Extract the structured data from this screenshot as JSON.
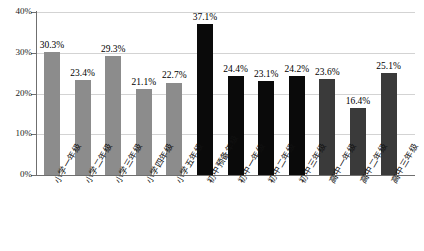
{
  "chart_data": {
    "type": "bar",
    "title": "",
    "subtitle": "",
    "xlabel": "",
    "ylabel": "",
    "ylim": [
      0,
      40
    ],
    "grid": true,
    "legend_position": "none",
    "ytick_labels": [
      "0%",
      "10%",
      "20%",
      "30%",
      "40%"
    ],
    "ytick_values": [
      0,
      10,
      20,
      30,
      40
    ],
    "categories": [
      "小学一年级",
      "小学二年级",
      "小学三年级",
      "小学四年级",
      "小学五年级",
      "初中预备年级",
      "初中一年级",
      "初中二年级",
      "初中三年级",
      "高中一年级",
      "高中二年级",
      "高中三年级"
    ],
    "values": [
      30.3,
      23.4,
      29.3,
      21.1,
      22.7,
      37.1,
      24.4,
      23.1,
      24.2,
      23.6,
      16.4,
      25.1
    ],
    "value_labels": [
      "30.3%",
      "23.4%",
      "29.3%",
      "21.1%",
      "22.7%",
      "37.1%",
      "24.4%",
      "23.1%",
      "24.2%",
      "23.6%",
      "16.4%",
      "25.1%"
    ],
    "bar_colors": [
      "#8c8c8c",
      "#8c8c8c",
      "#8c8c8c",
      "#8c8c8c",
      "#8c8c8c",
      "#0a0a0a",
      "#0a0a0a",
      "#0a0a0a",
      "#0a0a0a",
      "#3a3a3a",
      "#3a3a3a",
      "#3a3a3a"
    ],
    "colors": {
      "primary_gray": "#8c8c8c",
      "black": "#0a0a0a",
      "dark_gray": "#3a3a3a",
      "gridline": "#d3d3d3",
      "axis": "#6f6f6f",
      "background": "#ffffff",
      "text": "#111111"
    }
  }
}
